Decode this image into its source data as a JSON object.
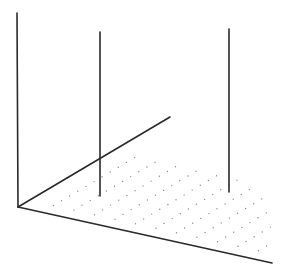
{
  "diagram": {
    "type": "3d-axes-with-impulses",
    "background": "#ffffff",
    "line_color": "#2a2a2a",
    "dot_color": "#8a8a8a",
    "origin": [
      18,
      207
    ],
    "axes": [
      {
        "name": "vertical-axis",
        "from": [
          18,
          207
        ],
        "to": [
          17,
          13
        ]
      },
      {
        "name": "depth-axis",
        "from": [
          18,
          207
        ],
        "to": [
          170,
          117
        ]
      },
      {
        "name": "horizontal-axis",
        "from": [
          18,
          207
        ],
        "to": [
          272,
          263
        ]
      }
    ],
    "impulses": [
      {
        "name": "impulse-left",
        "x": 100,
        "top": 32,
        "base": 196
      },
      {
        "name": "impulse-right",
        "x": 229,
        "top": 29,
        "base": 192
      }
    ],
    "dot_plane": {
      "u_dir": [
        152,
        -90
      ],
      "v_dir": [
        254,
        56
      ],
      "u_steps": 10,
      "v_steps": 10,
      "u_range": [
        0.12,
        0.98
      ],
      "v_range": [
        0.1,
        0.95
      ]
    }
  }
}
